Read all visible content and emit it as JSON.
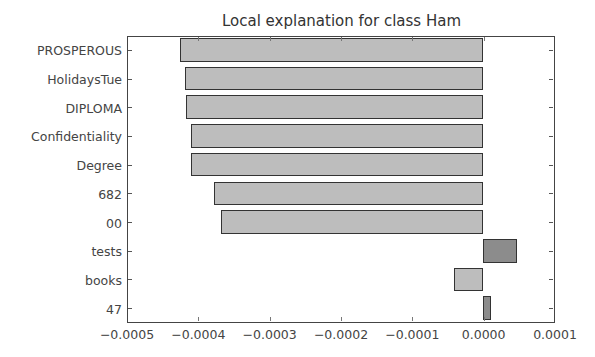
{
  "chart_data": {
    "type": "bar",
    "orientation": "horizontal",
    "title": "Local explanation for class Ham",
    "xlabel": "",
    "ylabel": "",
    "categories": [
      "PROSPEROUS",
      "HolidaysTue",
      "DIPLOMA",
      "Confidentiality",
      "Degree",
      "682",
      "00",
      "tests",
      "books",
      "47"
    ],
    "values": [
      -0.000425,
      -0.000418,
      -0.000416,
      -0.00041,
      -0.000409,
      -0.000377,
      -0.000367,
      4.8e-05,
      -4.1e-05,
      1.1e-05
    ],
    "bar_colors": [
      "#bdbdbd",
      "#bdbdbd",
      "#bdbdbd",
      "#bdbdbd",
      "#bdbdbd",
      "#bdbdbd",
      "#bdbdbd",
      "#8c8c8c",
      "#bdbdbd",
      "#8c8c8c"
    ],
    "xlim": [
      -0.0005,
      0.0001
    ],
    "xticks": [
      "−0.0005",
      "−0.0004",
      "−0.0003",
      "−0.0002",
      "−0.0001",
      "0.0000",
      "0.0001"
    ],
    "xtick_values": [
      -0.0005,
      -0.0004,
      -0.0003,
      -0.0002,
      -0.0001,
      0.0,
      0.0001
    ],
    "grid": false,
    "legend": null
  }
}
